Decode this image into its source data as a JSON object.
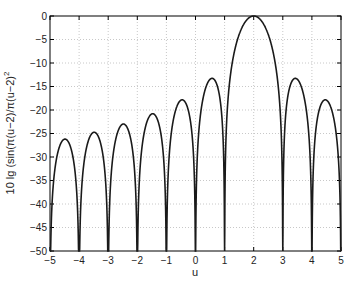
{
  "chart_data": {
    "type": "line",
    "title": "",
    "xlabel": "u",
    "ylabel": "10 lg (sin(π(u−2)/π(u−2)",
    "ylabel_sup": "2",
    "xlim": [
      -5,
      5
    ],
    "ylim": [
      -50,
      0
    ],
    "grid": true,
    "xticks": [
      "-5",
      "-4",
      "-3",
      "-2",
      "-1",
      "0",
      "1",
      "2",
      "3",
      "4",
      "5"
    ],
    "yticks": [
      "0",
      "-5",
      "-10",
      "-15",
      "-20",
      "-25",
      "-30",
      "-35",
      "-40",
      "-45",
      "-50"
    ],
    "function": "10*log10((sin(pi*(u-2))/(pi*(u-2)))^2)",
    "series": [
      {
        "name": "sinc^2 in dB",
        "x": [
          -5,
          -4.48,
          -4,
          -3.47,
          -3,
          -2.46,
          -2,
          -1.45,
          -1,
          -0.44,
          0,
          0.57,
          1,
          2,
          3,
          3.43,
          4,
          4.46,
          5
        ],
        "values": [
          -50,
          -26.2,
          -50,
          -24.8,
          -50,
          -23.0,
          -50,
          -20.8,
          -50,
          -17.8,
          -50,
          -13.3,
          -50,
          0,
          -50,
          -13.3,
          -50,
          -17.8,
          -50
        ]
      }
    ],
    "colors": {
      "line": "#1a1a1a",
      "grid": "#c8c8c8",
      "axis": "#000000"
    }
  }
}
